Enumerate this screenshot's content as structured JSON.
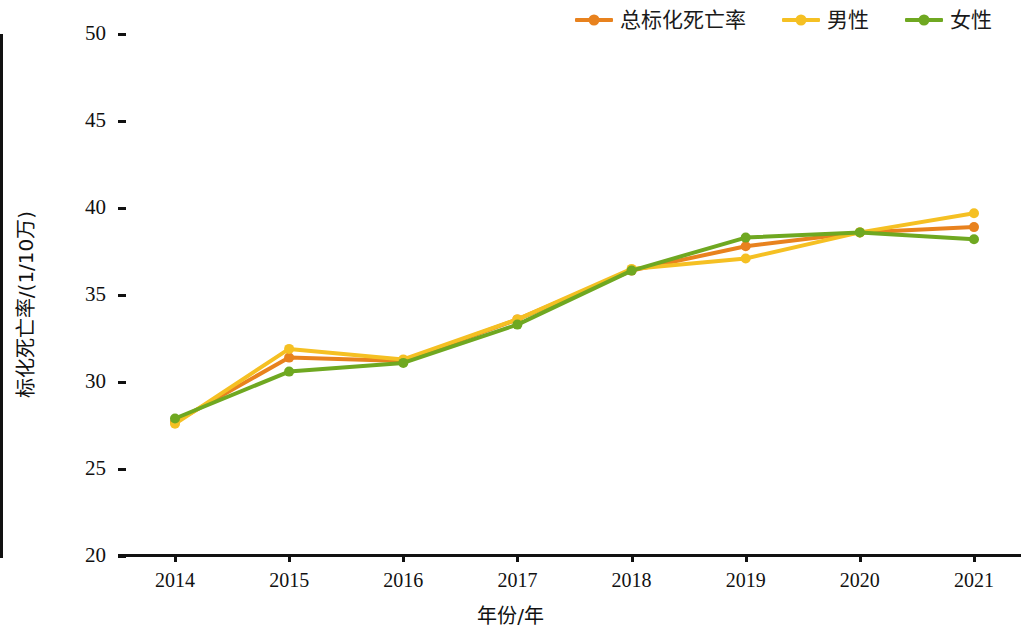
{
  "chart_data": {
    "type": "line",
    "title": "",
    "xlabel": "年份/年",
    "ylabel": "标化死亡率/(1/10万)",
    "categories": [
      "2014",
      "2015",
      "2016",
      "2017",
      "2018",
      "2019",
      "2020",
      "2021"
    ],
    "x": [
      2014,
      2015,
      2016,
      2017,
      2018,
      2019,
      2020,
      2021
    ],
    "ylim": [
      20,
      50
    ],
    "yticks": [
      20,
      25,
      30,
      35,
      40,
      45,
      50
    ],
    "grid": false,
    "legend_position": "top-right",
    "series": [
      {
        "name": "总标化死亡率",
        "color": "#E8821E",
        "values": [
          27.7,
          31.4,
          31.2,
          33.6,
          36.4,
          37.8,
          38.6,
          38.9
        ]
      },
      {
        "name": "男性",
        "color": "#F5C023",
        "values": [
          27.6,
          31.9,
          31.3,
          33.6,
          36.5,
          37.1,
          38.6,
          39.7
        ]
      },
      {
        "name": "女性",
        "color": "#6FA821",
        "values": [
          27.9,
          30.6,
          31.1,
          33.3,
          36.4,
          38.3,
          38.6,
          38.2
        ]
      }
    ]
  },
  "legend": {
    "items": [
      {
        "label": "总标化死亡率",
        "color": "#E8821E"
      },
      {
        "label": "男性",
        "color": "#F5C023"
      },
      {
        "label": "女性",
        "color": "#6FA821"
      }
    ]
  },
  "axes": {
    "y": {
      "ticks": [
        "50",
        "45",
        "40",
        "35",
        "30",
        "25",
        "20"
      ],
      "title": "标化死亡率/(1/10万)"
    },
    "x": {
      "ticks": [
        "2014",
        "2015",
        "2016",
        "2017",
        "2018",
        "2019",
        "2020",
        "2021"
      ],
      "title": "年份/年"
    }
  }
}
